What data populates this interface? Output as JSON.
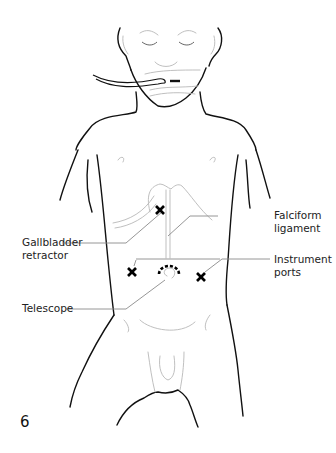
{
  "figure": {
    "number": "6",
    "labels": {
      "falciform": {
        "line1": "Falciform",
        "line2": "ligament"
      },
      "gallbladder": {
        "line1": "Gallbladder",
        "line2": "retractor"
      },
      "instrument": {
        "line1": "Instrument",
        "line2": "ports"
      },
      "telescope": {
        "line1": "Telescope"
      }
    },
    "markers": [
      {
        "name": "gallbladder-retractor-port",
        "x": 160,
        "y": 210,
        "symbol": "x"
      },
      {
        "name": "left-instrument-port",
        "x": 132,
        "y": 272,
        "symbol": "x"
      },
      {
        "name": "right-instrument-port",
        "x": 201,
        "y": 277,
        "symbol": "x"
      },
      {
        "name": "telescope-port",
        "x": 169,
        "y": 272,
        "symbol": "dashed-arc"
      }
    ],
    "colors": {
      "outline": "#111111",
      "faint": "#b8b8b8",
      "leader": "#8a8a8a",
      "marker": "#000000"
    }
  }
}
